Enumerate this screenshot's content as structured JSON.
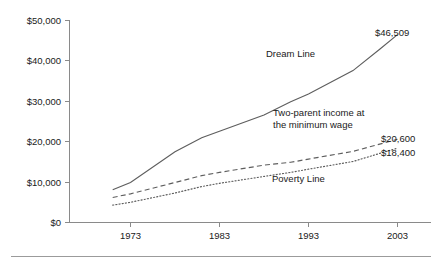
{
  "chart_data": {
    "type": "line",
    "title": "",
    "xlabel": "",
    "ylabel": "",
    "x": [
      1971,
      1973,
      1978,
      1981,
      1983,
      1988,
      1991,
      1993,
      1998,
      2001,
      2003
    ],
    "xlim": [
      1970,
      2004
    ],
    "ylim": [
      0,
      50000
    ],
    "grid": false,
    "legend_position": "inline-annotations",
    "x_tick_labels": [
      "1973",
      "1983",
      "1993",
      "2003"
    ],
    "x_tick_values": [
      1973,
      1983,
      1993,
      2003
    ],
    "y_tick_labels": [
      "$50,000",
      "$40,000",
      "$30,000",
      "$20,000",
      "$10,000",
      "$0"
    ],
    "y_tick_values": [
      50000,
      40000,
      30000,
      20000,
      10000,
      0
    ],
    "series": [
      {
        "name": "Dream Line",
        "style": "solid",
        "annotation": "Dream Line",
        "end_label": "$46,509",
        "values": [
          8100,
          9900,
          17500,
          21000,
          22600,
          26600,
          29900,
          31800,
          37600,
          42900,
          46509
        ]
      },
      {
        "name": "Two-parent income at the minimum wage",
        "style": "dashed",
        "annotation_line1": "Two-parent income at",
        "annotation_line2": "the minimum wage",
        "end_label": "$20,600",
        "values": [
          6200,
          7100,
          9900,
          11600,
          12400,
          14200,
          14900,
          15700,
          17600,
          19400,
          20600
        ]
      },
      {
        "name": "Poverty Line",
        "style": "dotted",
        "annotation": "Poverty Line",
        "end_label": "$18,400",
        "values": [
          4300,
          5000,
          7300,
          8900,
          9700,
          11400,
          12400,
          13200,
          15100,
          17100,
          18400
        ]
      }
    ],
    "colors": {
      "line": "#5e5e5e",
      "axis": "#8a8a8a",
      "text": "#1a1a1a",
      "rule": "#9b9b9b",
      "background": "#ffffff"
    }
  }
}
